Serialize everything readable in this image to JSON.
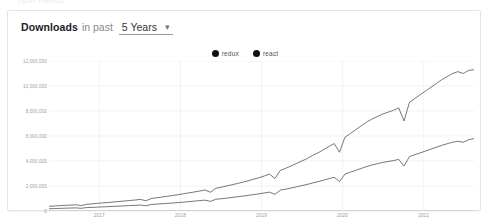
{
  "page": {
    "background": "#ffffff",
    "top_partial_text": "npm trends"
  },
  "card": {
    "header": {
      "title": "Downloads",
      "subtitle": "in past",
      "range_value": "5 Years",
      "range_caret": "▾"
    },
    "legend": {
      "items": [
        {
          "label": "redux",
          "color": "#111111"
        },
        {
          "label": "react",
          "color": "#111111"
        }
      ]
    }
  },
  "chart_data": {
    "type": "line",
    "title": "Downloads in past 5 Years",
    "xlabel": "",
    "ylabel": "",
    "grid": true,
    "legend_position": "top-center",
    "ylim": [
      0,
      12000000
    ],
    "yticks": [
      0,
      2000000,
      4000000,
      6000000,
      8000000,
      10000000,
      12000000
    ],
    "ytick_labels": [
      "0",
      "2,000,000",
      "4,000,000",
      "6,000,000",
      "8,000,000",
      "10,000,000",
      "12,000,000"
    ],
    "xticks": [
      "2017",
      "2018",
      "2019",
      "2020",
      "2021"
    ],
    "xlim": [
      "2016-06",
      "2021-06"
    ],
    "series": [
      {
        "name": "react",
        "color": "#4a4a4a",
        "values": [
          380000,
          400000,
          430000,
          455000,
          470000,
          500000,
          430000,
          540000,
          570000,
          610000,
          650000,
          680000,
          720000,
          760000,
          800000,
          840000,
          880000,
          930000,
          820000,
          1000000,
          1060000,
          1120000,
          1180000,
          1240000,
          1300000,
          1380000,
          1450000,
          1520000,
          1600000,
          1680000,
          1500000,
          1820000,
          1900000,
          2000000,
          2100000,
          2200000,
          2300000,
          2420000,
          2540000,
          2660000,
          2800000,
          2950000,
          2600000,
          3250000,
          3420000,
          3600000,
          3800000,
          4000000,
          4200000,
          4450000,
          4650000,
          4900000,
          5150000,
          5400000,
          4700000,
          5900000,
          6200000,
          6500000,
          6800000,
          7100000,
          7350000,
          7550000,
          7750000,
          7900000,
          8050000,
          8250000,
          7200000,
          8700000,
          9000000,
          9300000,
          9600000,
          9900000,
          10200000,
          10500000,
          10750000,
          11000000,
          11150000,
          11000000,
          11250000,
          11300000
        ]
      },
      {
        "name": "redux",
        "color": "#4a4a4a",
        "values": [
          180000,
          195000,
          210000,
          225000,
          235000,
          250000,
          215000,
          275000,
          290000,
          310000,
          330000,
          350000,
          370000,
          390000,
          410000,
          435000,
          455000,
          480000,
          420000,
          520000,
          550000,
          580000,
          610000,
          640000,
          675000,
          710000,
          750000,
          790000,
          830000,
          870000,
          770000,
          940000,
          980000,
          1030000,
          1080000,
          1140000,
          1190000,
          1250000,
          1310000,
          1370000,
          1440000,
          1510000,
          1330000,
          1670000,
          1750000,
          1840000,
          1930000,
          2030000,
          2130000,
          2240000,
          2350000,
          2460000,
          2580000,
          2700000,
          2350000,
          2950000,
          3100000,
          3250000,
          3400000,
          3550000,
          3680000,
          3780000,
          3880000,
          3960000,
          4030000,
          4130000,
          3600000,
          4350000,
          4500000,
          4650000,
          4800000,
          4950000,
          5100000,
          5250000,
          5380000,
          5500000,
          5580000,
          5500000,
          5700000,
          5800000
        ]
      }
    ]
  }
}
